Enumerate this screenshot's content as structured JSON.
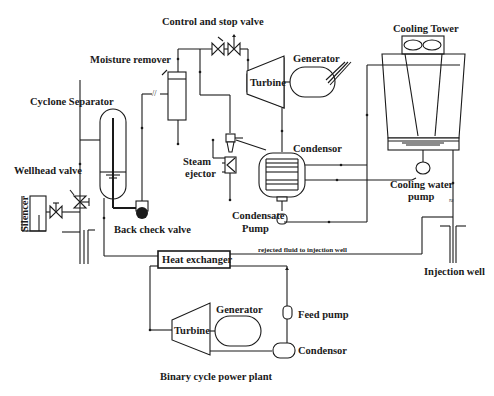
{
  "diagram": {
    "title": "Binary cycle power plant",
    "labels": {
      "control_stop_valve": "Control and stop valve",
      "moisture_remover": "Moisture remover",
      "cyclone_separator": "Cyclone Separator",
      "wellhead_valve": "Wellhead valve",
      "silencer": "Silencer",
      "back_check_valve": "Back check valve",
      "steam_ejector_1": "Steam",
      "steam_ejector_2": "ejector",
      "turbine_top": "Turbine",
      "generator_top": "Generator",
      "condensor_top": "Condensor",
      "condensate_pump_1": "Condensate",
      "condensate_pump_2": "Pump",
      "cooling_tower": "Cooling Tower",
      "cooling_water_pump_1": "Cooling water",
      "cooling_water_pump_2": "pump",
      "rejected_fluid": "rejected fluid to injection well",
      "injection_well": "Injection well",
      "heat_exchanger": "Heat exchanger",
      "turbine_binary": "Turbine",
      "generator_binary": "Generator",
      "feed_pump": "Feed pump",
      "condensor_binary": "Condensor",
      "binary_title": "Binary cycle power plant"
    },
    "colors": {
      "line": "#1a1a1a",
      "background": "#ffffff"
    }
  }
}
